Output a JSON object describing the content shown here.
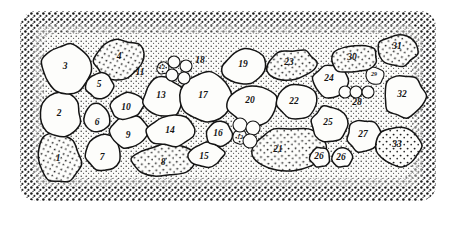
{
  "figure": {
    "type": "scientific-illustration",
    "style": "pen-and-ink stipple drawing",
    "background_color": "#ffffff",
    "ink_color": "#141414",
    "matrix_color": "#55504a",
    "cell_fill_color": "#fdfdfb",
    "border": {
      "name": "stippled-margin",
      "description": "dense dot stipple band framing the specimen on all four sides"
    },
    "canvas": {
      "width": 457,
      "height": 225
    },
    "specimen_bounds": {
      "x": 20,
      "y": 11,
      "width": 416,
      "height": 190
    }
  },
  "chart_data": {
    "type": "scatter",
    "title": "",
    "xlabel": "",
    "ylabel": "",
    "legend": [],
    "grid": false,
    "categories": [
      "1",
      "2",
      "3",
      "4",
      "5",
      "6",
      "7",
      "8",
      "9",
      "10",
      "11",
      "12",
      "13",
      "14",
      "15",
      "16",
      "17",
      "18",
      "19",
      "20",
      "21",
      "22",
      "23",
      "24",
      "25",
      "26",
      "26",
      "27",
      "28",
      "29",
      "30",
      "31",
      "32",
      "33",
      "12"
    ],
    "values": [
      38,
      52,
      64,
      54,
      26,
      24,
      34,
      44,
      33,
      31,
      20,
      9,
      40,
      44,
      27,
      24,
      58,
      20,
      44,
      48,
      62,
      42,
      50,
      42,
      44,
      17,
      17,
      34,
      20,
      19,
      46,
      44,
      44,
      50,
      9
    ],
    "points": [
      {
        "label": "1",
        "x": 59,
        "y": 158,
        "rx": 21,
        "ry": 25,
        "rot": -18,
        "fill": "stipple",
        "lx": 58,
        "ly": 159
      },
      {
        "label": "2",
        "x": 60,
        "y": 115,
        "rx": 21,
        "ry": 22,
        "rot": -8,
        "fill": "plain",
        "lx": 59,
        "ly": 114
      },
      {
        "label": "3",
        "x": 66,
        "y": 69,
        "rx": 24,
        "ry": 25,
        "rot": 5,
        "fill": "plain",
        "lx": 65,
        "ly": 67
      },
      {
        "label": "4",
        "x": 119,
        "y": 60,
        "rx": 25,
        "ry": 20,
        "rot": -14,
        "fill": "stipple",
        "lx": 119,
        "ly": 57
      },
      {
        "label": "5",
        "x": 100,
        "y": 86,
        "rx": 14,
        "ry": 13,
        "rot": 0,
        "fill": "plain",
        "lx": 99,
        "ly": 85
      },
      {
        "label": "6",
        "x": 97,
        "y": 118,
        "rx": 13,
        "ry": 14,
        "rot": 0,
        "fill": "plain",
        "lx": 97,
        "ly": 123
      },
      {
        "label": "7",
        "x": 103,
        "y": 153,
        "rx": 18,
        "ry": 18,
        "rot": 0,
        "fill": "plain",
        "lx": 102,
        "ly": 158
      },
      {
        "label": "8",
        "x": 165,
        "y": 160,
        "rx": 32,
        "ry": 16,
        "rot": -4,
        "fill": "stipple",
        "lx": 163,
        "ly": 163
      },
      {
        "label": "9",
        "x": 129,
        "y": 132,
        "rx": 19,
        "ry": 16,
        "rot": -6,
        "fill": "plain",
        "lx": 128,
        "ly": 136
      },
      {
        "label": "10",
        "x": 127,
        "y": 106,
        "rx": 17,
        "ry": 13,
        "rot": -8,
        "fill": "plain",
        "lx": 126,
        "ly": 108
      },
      {
        "label": "11",
        "x": 142,
        "y": 74,
        "rx": 0,
        "ry": 0,
        "rot": 0,
        "fill": "none",
        "lx": 140,
        "ly": 73
      },
      {
        "label": "12",
        "x": 163,
        "y": 68,
        "rx": 6,
        "ry": 6,
        "rot": 0,
        "fill": "stipple",
        "lx": 162,
        "ly": 68
      },
      {
        "label": "13",
        "x": 163,
        "y": 98,
        "rx": 20,
        "ry": 20,
        "rot": 0,
        "fill": "plain",
        "lx": 161,
        "ly": 96
      },
      {
        "label": "14",
        "x": 172,
        "y": 131,
        "rx": 25,
        "ry": 15,
        "rot": -4,
        "fill": "plain",
        "lx": 170,
        "ly": 131
      },
      {
        "label": "15",
        "x": 206,
        "y": 155,
        "rx": 18,
        "ry": 12,
        "rot": -6,
        "fill": "plain",
        "lx": 204,
        "ly": 157
      },
      {
        "label": "16",
        "x": 219,
        "y": 134,
        "rx": 13,
        "ry": 12,
        "rot": 0,
        "fill": "plain",
        "lx": 218,
        "ly": 134
      },
      {
        "label": "17",
        "x": 205,
        "y": 97,
        "rx": 27,
        "ry": 24,
        "rot": 3,
        "fill": "plain",
        "lx": 203,
        "ly": 96
      },
      {
        "label": "18",
        "x": 201,
        "y": 61,
        "rx": 0,
        "ry": 0,
        "rot": 0,
        "fill": "none",
        "lx": 200,
        "ly": 61
      },
      {
        "label": "19",
        "x": 245,
        "y": 67,
        "rx": 22,
        "ry": 17,
        "rot": -10,
        "fill": "plain",
        "lx": 243,
        "ly": 65
      },
      {
        "label": "20",
        "x": 253,
        "y": 105,
        "rx": 25,
        "ry": 21,
        "rot": 3,
        "fill": "plain",
        "lx": 250,
        "ly": 101
      },
      {
        "label": "21",
        "x": 288,
        "y": 149,
        "rx": 36,
        "ry": 22,
        "rot": -3,
        "fill": "stipple",
        "lx": 278,
        "ly": 150
      },
      {
        "label": "22",
        "x": 296,
        "y": 101,
        "rx": 20,
        "ry": 18,
        "rot": 0,
        "fill": "plain",
        "lx": 294,
        "ly": 102
      },
      {
        "label": "23",
        "x": 291,
        "y": 65,
        "rx": 26,
        "ry": 15,
        "rot": -6,
        "fill": "stipple",
        "lx": 289,
        "ly": 63
      },
      {
        "label": "24",
        "x": 331,
        "y": 81,
        "rx": 18,
        "ry": 17,
        "rot": 0,
        "fill": "plain",
        "lx": 329,
        "ly": 79
      },
      {
        "label": "25",
        "x": 330,
        "y": 124,
        "rx": 19,
        "ry": 18,
        "rot": 0,
        "fill": "plain",
        "lx": 328,
        "ly": 123
      },
      {
        "label": "26",
        "x": 320,
        "y": 157,
        "rx": 10,
        "ry": 10,
        "rot": 0,
        "fill": "plain",
        "lx": 319,
        "ly": 157
      },
      {
        "label": "26",
        "x": 342,
        "y": 157,
        "rx": 10,
        "ry": 10,
        "rot": 0,
        "fill": "plain",
        "lx": 341,
        "ly": 158
      },
      {
        "label": "27",
        "x": 364,
        "y": 136,
        "rx": 17,
        "ry": 16,
        "rot": 0,
        "fill": "plain",
        "lx": 363,
        "ly": 135
      },
      {
        "label": "28",
        "x": 358,
        "y": 104,
        "rx": 0,
        "ry": 0,
        "rot": 0,
        "fill": "none",
        "lx": 357,
        "ly": 103
      },
      {
        "label": "29",
        "x": 375,
        "y": 76,
        "rx": 9,
        "ry": 9,
        "rot": 0,
        "fill": "plain",
        "lx": 374,
        "ly": 75
      },
      {
        "label": "30",
        "x": 354,
        "y": 59,
        "rx": 23,
        "ry": 14,
        "rot": -8,
        "fill": "stipple",
        "lx": 352,
        "ly": 58
      },
      {
        "label": "31",
        "x": 398,
        "y": 50,
        "rx": 21,
        "ry": 16,
        "rot": -10,
        "fill": "stipple",
        "lx": 397,
        "ly": 47
      },
      {
        "label": "32",
        "x": 404,
        "y": 96,
        "rx": 21,
        "ry": 21,
        "rot": 0,
        "fill": "plain",
        "lx": 402,
        "ly": 95
      },
      {
        "label": "33",
        "x": 399,
        "y": 146,
        "rx": 22,
        "ry": 20,
        "rot": 0,
        "fill": "stipple",
        "lx": 397,
        "ly": 145
      },
      {
        "label": "12",
        "x": 240,
        "y": 137,
        "rx": 7,
        "ry": 7,
        "rot": 0,
        "fill": "stipple",
        "lx": 240,
        "ly": 138
      }
    ],
    "satellite_vesicles": [
      {
        "group": "upper-cluster",
        "x": 174,
        "y": 62,
        "r": 6
      },
      {
        "group": "upper-cluster",
        "x": 186,
        "y": 66,
        "r": 6
      },
      {
        "group": "upper-cluster",
        "x": 172,
        "y": 75,
        "r": 6
      },
      {
        "group": "upper-cluster",
        "x": 184,
        "y": 78,
        "r": 6
      },
      {
        "group": "lower-cluster",
        "x": 240,
        "y": 125,
        "r": 7
      },
      {
        "group": "lower-cluster",
        "x": 253,
        "y": 128,
        "r": 7
      },
      {
        "group": "lower-cluster",
        "x": 250,
        "y": 141,
        "r": 7
      },
      {
        "group": "right-cluster",
        "x": 345,
        "y": 92,
        "r": 6
      },
      {
        "group": "right-cluster",
        "x": 356,
        "y": 92,
        "r": 6
      },
      {
        "group": "right-cluster",
        "x": 368,
        "y": 92,
        "r": 6
      }
    ]
  }
}
